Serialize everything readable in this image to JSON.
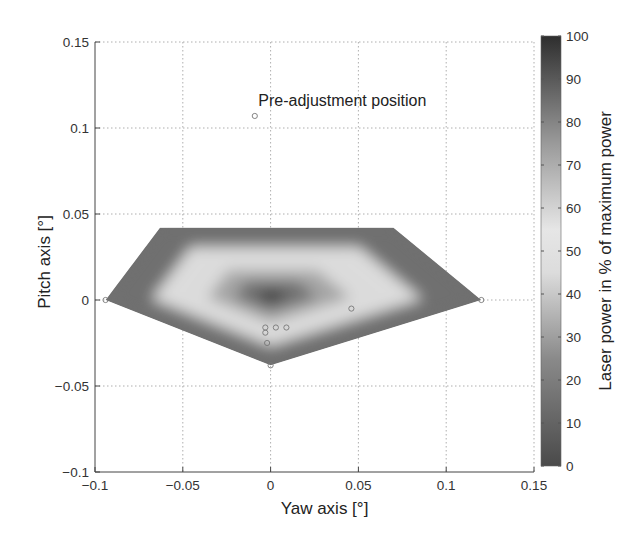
{
  "chart_data": {
    "type": "heatmap",
    "title": "",
    "xlabel": "Yaw axis [°]",
    "ylabel": "Pitch axis [°]",
    "xlim": [
      -0.1,
      0.15
    ],
    "ylim": [
      -0.1,
      0.15
    ],
    "xticks": [
      -0.1,
      -0.05,
      0,
      0.05,
      0.1,
      0.15
    ],
    "xtick_labels": [
      "−0.1",
      "−0.05",
      "0",
      "0.05",
      "0.1",
      "0.15"
    ],
    "yticks": [
      -0.1,
      -0.05,
      0,
      0.05,
      0.1,
      0.15
    ],
    "ytick_labels": [
      "−0.1",
      "−0.05",
      "0",
      "0.05",
      "0.1",
      "0.15"
    ],
    "grid": true,
    "colorbar": {
      "label": "Laser power in % of maximum power",
      "range": [
        0,
        100
      ],
      "ticks": [
        0,
        10,
        20,
        30,
        40,
        50,
        60,
        70,
        80,
        90,
        100
      ],
      "colormap": [
        {
          "v": 0,
          "color": "#4a4a4a"
        },
        {
          "v": 25,
          "color": "#8a8a8a"
        },
        {
          "v": 45,
          "color": "#dcdcdc"
        },
        {
          "v": 55,
          "color": "#e6e6e6"
        },
        {
          "v": 75,
          "color": "#9a9a9a"
        },
        {
          "v": 100,
          "color": "#2e2e2e"
        }
      ]
    },
    "surface": {
      "boundary": [
        {
          "x": -0.094,
          "y": 0.0
        },
        {
          "x": -0.063,
          "y": 0.042
        },
        {
          "x": 0.07,
          "y": 0.042
        },
        {
          "x": 0.12,
          "y": 0.0
        },
        {
          "x": 0.0,
          "y": -0.038
        }
      ],
      "peak": {
        "x": 0.0,
        "y": 0.002,
        "value": 100
      },
      "levels": [
        {
          "scale": 1.0,
          "value": 15
        },
        {
          "scale": 0.72,
          "value": 45
        },
        {
          "scale": 0.55,
          "value": 58
        },
        {
          "scale": 0.38,
          "value": 72
        },
        {
          "scale": 0.22,
          "value": 85
        },
        {
          "scale": 0.08,
          "value": 97
        }
      ]
    },
    "points": [
      {
        "x": -0.009,
        "y": 0.107
      },
      {
        "x": -0.094,
        "y": 0.0
      },
      {
        "x": 0.12,
        "y": 0.0
      },
      {
        "x": 0.0,
        "y": -0.038
      },
      {
        "x": 0.046,
        "y": -0.005
      },
      {
        "x": -0.003,
        "y": -0.016
      },
      {
        "x": -0.003,
        "y": -0.019
      },
      {
        "x": 0.003,
        "y": -0.016
      },
      {
        "x": 0.009,
        "y": -0.016
      },
      {
        "x": -0.002,
        "y": -0.025
      }
    ],
    "annotations": [
      {
        "text": "Pre-adjustment position",
        "x": -0.007,
        "y": 0.113
      }
    ]
  }
}
